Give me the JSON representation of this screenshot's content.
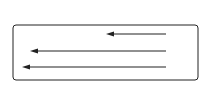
{
  "diagram": {
    "colors": {
      "stroke": "#222222",
      "background": "#ffffff"
    },
    "top_currents": {
      "symbol": "current-into-page",
      "count": 4,
      "x": [
        29,
        75,
        121,
        166
      ],
      "y": 16
    },
    "bottom_currents": {
      "symbol": "current-out-of-page",
      "count": 4,
      "x": [
        29,
        75,
        121,
        166
      ],
      "y": 87
    },
    "material_block": {
      "x": 13,
      "y": 25,
      "width": 185,
      "height": 55
    },
    "vectors": [
      {
        "id": "B0",
        "label": "B",
        "subscript": "0",
        "x_start": 166,
        "x_end": 106,
        "y": 34
      },
      {
        "id": "M",
        "label": "M",
        "subscript": "",
        "x_start": 166,
        "x_end": 30,
        "y": 51
      },
      {
        "id": "B",
        "label": "B",
        "subscript": "",
        "x_start": 166,
        "x_end": 22,
        "y": 67
      }
    ]
  }
}
